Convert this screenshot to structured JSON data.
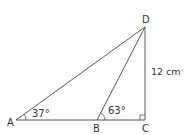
{
  "diagram": {
    "points": {
      "A": {
        "label": "A",
        "x": 16,
        "y": 120
      },
      "B": {
        "label": "B",
        "x": 97,
        "y": 120
      },
      "C": {
        "label": "C",
        "x": 145,
        "y": 120
      },
      "D": {
        "label": "D",
        "x": 145,
        "y": 27
      }
    },
    "angles": {
      "A": "37°",
      "B": "63°"
    },
    "side_DC": "12 cm",
    "colors": {
      "line": "#555555",
      "text": "#333333"
    }
  }
}
